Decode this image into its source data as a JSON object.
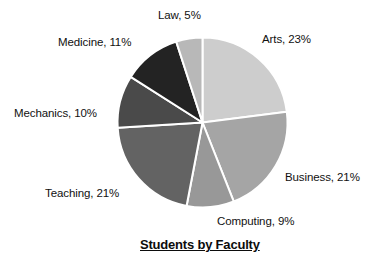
{
  "chart_data": {
    "type": "pie",
    "title": "Students by Faculty",
    "xlabel": "",
    "ylabel": "",
    "legend_position": "none",
    "grid": false,
    "start_angle_deg": 0,
    "direction": "clockwise",
    "categories": [
      "Arts",
      "Business",
      "Computing",
      "Teaching",
      "Mechanics",
      "Medicine",
      "Law"
    ],
    "values": [
      23,
      21,
      9,
      21,
      10,
      11,
      5
    ],
    "unit": "%",
    "slices": [
      {
        "label": "Arts",
        "value": 23,
        "label_text": "Arts, 23%",
        "color": "#cdcdcd"
      },
      {
        "label": "Business",
        "value": 21,
        "label_text": "Business, 21%",
        "color": "#a5a5a5"
      },
      {
        "label": "Computing",
        "value": 9,
        "label_text": "Computing, 9%",
        "color": "#989898"
      },
      {
        "label": "Teaching",
        "value": 21,
        "label_text": "Teaching, 21%",
        "color": "#636363"
      },
      {
        "label": "Mechanics",
        "value": 10,
        "label_text": "Mechanics, 10%",
        "color": "#4a4a4a"
      },
      {
        "label": "Medicine",
        "value": 11,
        "label_text": "Medicine, 11%",
        "color": "#232323"
      },
      {
        "label": "Law",
        "value": 5,
        "label_text": "Law, 5%",
        "color": "#b8b8b8"
      }
    ],
    "separator_color": "#ffffff",
    "background_color": "#ffffff",
    "text_color": "#111111"
  },
  "labels": {
    "arts": "Arts, 23%",
    "business": "Business, 21%",
    "computing": "Computing, 9%",
    "teaching": "Teaching, 21%",
    "mechanics": "Mechanics, 10%",
    "medicine": "Medicine, 11%",
    "law": "Law, 5%"
  },
  "title": "Students by Faculty"
}
